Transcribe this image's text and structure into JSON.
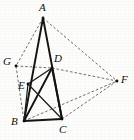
{
  "figure": {
    "background_color": "#fdfdfb",
    "solid_stroke_color": "#141414",
    "dashed_stroke_color": "#4a4a4a",
    "vertices": [
      {
        "id": "A",
        "label": "A",
        "x": 43,
        "y": 18,
        "label_x": 39,
        "label_y": 2
      },
      {
        "id": "B",
        "label": "B",
        "x": 24,
        "y": 121,
        "label_x": 11,
        "label_y": 116
      },
      {
        "id": "C",
        "label": "C",
        "x": 62,
        "y": 119,
        "label_x": 59,
        "label_y": 124
      },
      {
        "id": "D",
        "label": "D",
        "x": 52,
        "y": 68,
        "label_x": 54,
        "label_y": 53
      },
      {
        "id": "E",
        "label": "E",
        "x": 28,
        "y": 84,
        "label_x": 18,
        "label_y": 80
      },
      {
        "id": "F",
        "label": "F",
        "x": 117,
        "y": 81,
        "label_x": 121,
        "label_y": 74
      },
      {
        "id": "G",
        "label": "G",
        "x": 16,
        "y": 66,
        "label_x": 3,
        "label_y": 56
      }
    ],
    "edges_solid": [
      {
        "name": "segment-AB",
        "from": "A",
        "to": "B"
      },
      {
        "name": "segment-AC",
        "from": "A",
        "to": "C"
      },
      {
        "name": "segment-BC",
        "from": "B",
        "to": "C"
      },
      {
        "name": "segment-BD",
        "from": "B",
        "to": "D"
      },
      {
        "name": "segment-DC",
        "from": "D",
        "to": "C"
      },
      {
        "name": "segment-ED",
        "from": "E",
        "to": "D"
      },
      {
        "name": "segment-EC",
        "from": "E",
        "to": "C"
      },
      {
        "name": "segment-BE",
        "from": "B",
        "to": "E"
      }
    ],
    "edges_dashed": [
      {
        "name": "segment-AG",
        "from": "A",
        "to": "G"
      },
      {
        "name": "segment-AF",
        "from": "A",
        "to": "F"
      },
      {
        "name": "segment-GD",
        "from": "G",
        "to": "D"
      },
      {
        "name": "segment-GB",
        "from": "G",
        "to": "B"
      },
      {
        "name": "segment-DF",
        "from": "D",
        "to": "F"
      },
      {
        "name": "segment-CF",
        "from": "C",
        "to": "F"
      },
      {
        "name": "segment-BF",
        "from": "B",
        "to": "F"
      }
    ]
  }
}
